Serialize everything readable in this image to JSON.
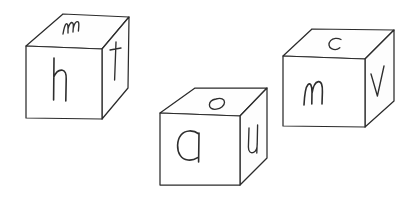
{
  "scene": {
    "title": "Three hand-drawn cubes with letters",
    "background_color": "#ffffff",
    "stroke_color": "#2b2b2b",
    "letter_color": "#2e2e2e",
    "width": 418,
    "height": 201
  },
  "cubes": [
    {
      "id": "cube-left",
      "position": "left",
      "letters": {
        "top": "m",
        "front": "h",
        "right": "t"
      }
    },
    {
      "id": "cube-middle",
      "position": "middle",
      "letters": {
        "top": "o",
        "front": "a",
        "right": "u"
      }
    },
    {
      "id": "cube-right",
      "position": "right",
      "letters": {
        "top": "c",
        "front": "m",
        "right": "v"
      }
    }
  ],
  "all_letters": "m h t o a u c m v"
}
